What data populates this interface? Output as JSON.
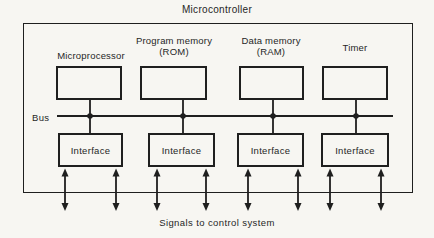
{
  "title": "Microcontroller",
  "bus": {
    "label": "Bus"
  },
  "caption": "Signals to control system",
  "columns": [
    {
      "label_line1": "Microprocessor",
      "label_line2": "",
      "interface_label": "Interface"
    },
    {
      "label_line1": "Program memory",
      "label_line2": "(ROM)",
      "interface_label": "Interface"
    },
    {
      "label_line1": "Data memory",
      "label_line2": "(RAM)",
      "interface_label": "Interface"
    },
    {
      "label_line1": "Timer",
      "label_line2": "",
      "interface_label": "Interface"
    }
  ],
  "colors": {
    "line": "#1f1f1f",
    "background": "#f7f6f2",
    "text": "#262626"
  }
}
